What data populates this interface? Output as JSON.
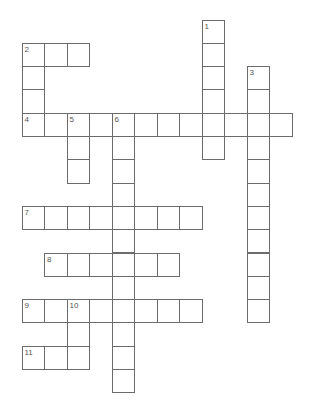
{
  "puzzle": {
    "type": "crossword",
    "grid": {
      "origin_x": 22,
      "origin_y": 20,
      "cell_w": 22.5,
      "cell_h": 23.3,
      "line_color": "#6b6b6b"
    },
    "entries": [
      {
        "number": "1",
        "direction": "down",
        "row": 0,
        "col": 8,
        "length": 6
      },
      {
        "number": "2",
        "direction": "across",
        "row": 1,
        "col": 0,
        "length": 3
      },
      {
        "number": "2",
        "direction": "down",
        "row": 1,
        "col": 0,
        "length": 4
      },
      {
        "number": "3",
        "direction": "down",
        "row": 2,
        "col": 10,
        "length": 11
      },
      {
        "number": "4",
        "direction": "across",
        "row": 4,
        "col": 0,
        "length": 12
      },
      {
        "number": "5",
        "direction": "down",
        "row": 4,
        "col": 2,
        "length": 3
      },
      {
        "number": "6",
        "direction": "down",
        "row": 4,
        "col": 4,
        "length": 12
      },
      {
        "number": "7",
        "direction": "across",
        "row": 8,
        "col": 0,
        "length": 8
      },
      {
        "number": "8",
        "direction": "across",
        "row": 10,
        "col": 1,
        "length": 6
      },
      {
        "number": "9",
        "direction": "across",
        "row": 12,
        "col": 0,
        "length": 8
      },
      {
        "number": "10",
        "direction": "down",
        "row": 12,
        "col": 2,
        "length": 3
      },
      {
        "number": "11",
        "direction": "across",
        "row": 14,
        "col": 0,
        "length": 3
      }
    ]
  }
}
